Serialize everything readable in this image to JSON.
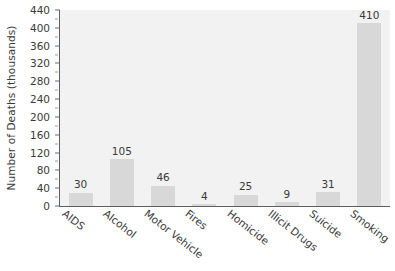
{
  "chart_data": {
    "type": "bar",
    "title": "",
    "xlabel": "",
    "ylabel": "Number of Deaths (thousands)",
    "categories": [
      "AIDS",
      "Alcohol",
      "Motor Vehicle",
      "Fires",
      "Homicide",
      "Illicit Drugs",
      "Suicide",
      "Smoking"
    ],
    "values": [
      30,
      105,
      46,
      4,
      25,
      9,
      31,
      410
    ],
    "value_labels": [
      "30",
      "105",
      "46",
      "4",
      "25",
      "9",
      "31",
      "410"
    ],
    "ylim": [
      0,
      440
    ],
    "y_ticks": [
      0,
      40,
      80,
      120,
      160,
      200,
      240,
      280,
      320,
      360,
      400,
      440
    ],
    "y_tick_labels": [
      "0",
      "40",
      "80",
      "120",
      "160",
      "200",
      "240",
      "280",
      "320",
      "360",
      "400",
      "440"
    ],
    "y_minor_ticks": [
      20,
      60,
      100,
      140,
      180,
      220,
      260,
      300,
      340,
      380,
      420
    ],
    "grid": false,
    "legend": false,
    "bar_color": "#d8d8d8",
    "plot_background": "#f2f2f2",
    "axis_color": "#5e5e5e",
    "text_color": "#3a3a3a"
  }
}
